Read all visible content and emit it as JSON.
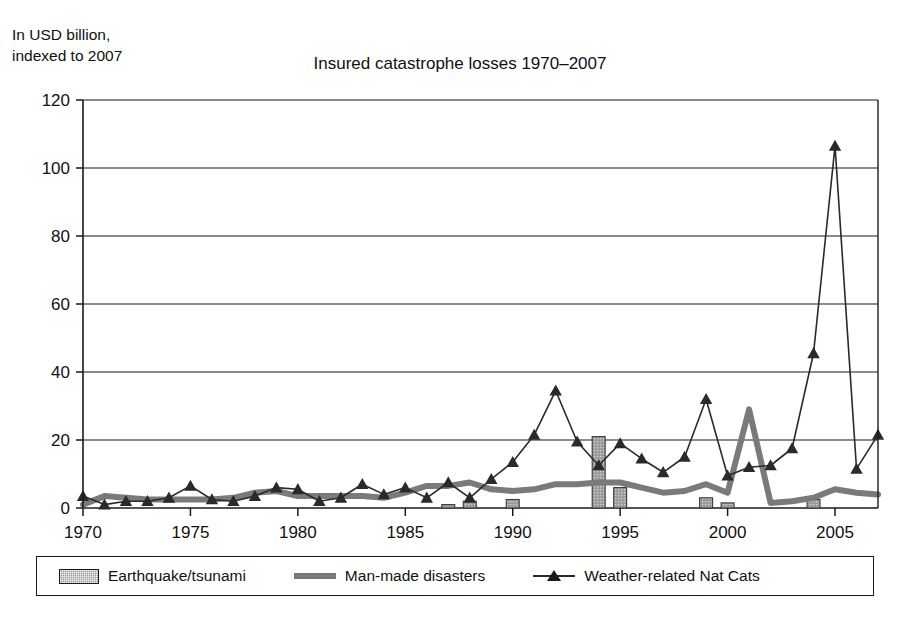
{
  "axis_caption": "In USD billion,\nindexed to 2007",
  "title": "Insured catastrophe losses 1970–2007",
  "legend": {
    "earthquake_label": "Earthquake/tsunami",
    "manmade_label": "Man-made disasters",
    "weather_label": "Weather-related Nat Cats"
  },
  "colors": {
    "earthquake_bar": "#9a9a9a",
    "manmade_line": "#7a7a7a",
    "weather_line": "#2a2a2a",
    "axis": "#1a1a1a",
    "grid": "#1a1a1a",
    "background": "#ffffff"
  },
  "chart_data": {
    "type": "line",
    "title": "Insured catastrophe losses 1970–2007",
    "subtitle": "In USD billion, indexed to 2007",
    "xlabel": "",
    "ylabel": "In USD billion, indexed to 2007",
    "xlim": [
      1970,
      2007
    ],
    "ylim": [
      0,
      120
    ],
    "yticks": [
      0,
      20,
      40,
      60,
      80,
      100,
      120
    ],
    "ytick_labels": [
      "0",
      "20",
      "40",
      "60",
      "80",
      "100",
      "120"
    ],
    "xticks": [
      1970,
      1975,
      1980,
      1985,
      1990,
      1995,
      2000,
      2005
    ],
    "xtick_labels": [
      "1970",
      "1975",
      "1980",
      "1985",
      "1990",
      "1995",
      "2000",
      "2005"
    ],
    "grid": "horizontal",
    "legend_position": "bottom",
    "x": [
      1970,
      1971,
      1972,
      1973,
      1974,
      1975,
      1976,
      1977,
      1978,
      1979,
      1980,
      1981,
      1982,
      1983,
      1984,
      1985,
      1986,
      1987,
      1988,
      1989,
      1990,
      1991,
      1992,
      1993,
      1994,
      1995,
      1996,
      1997,
      1998,
      1999,
      2000,
      2001,
      2002,
      2003,
      2004,
      2005,
      2006,
      2007
    ],
    "series": [
      {
        "name": "Weather-related Nat Cats",
        "type": "line",
        "marker": "triangle",
        "color": "#2a2a2a",
        "values": [
          3.5,
          1.0,
          2.0,
          2.0,
          3.0,
          6.5,
          2.5,
          2.0,
          3.5,
          6.0,
          5.5,
          2.0,
          3.0,
          7.0,
          4.0,
          6.0,
          3.0,
          7.5,
          3.0,
          8.5,
          13.5,
          21.5,
          34.5,
          19.5,
          12.5,
          19.0,
          14.5,
          10.5,
          15.0,
          32.0,
          9.5,
          12.0,
          12.5,
          17.5,
          45.5,
          106.5,
          11.5,
          21.5
        ]
      },
      {
        "name": "Man-made disasters",
        "type": "line",
        "marker": "none",
        "color": "#7a7a7a",
        "values": [
          1.0,
          3.5,
          3.0,
          2.5,
          2.5,
          2.5,
          2.5,
          3.0,
          4.5,
          5.0,
          3.5,
          3.5,
          3.5,
          3.5,
          3.0,
          4.5,
          6.5,
          6.5,
          7.5,
          5.5,
          5.0,
          5.5,
          7.0,
          7.0,
          7.5,
          7.5,
          6.0,
          4.5,
          5.0,
          7.0,
          4.5,
          29.0,
          1.5,
          2.0,
          3.0,
          5.5,
          4.5,
          4.0
        ]
      },
      {
        "name": "Earthquake/tsunami",
        "type": "bar",
        "color": "#9a9a9a",
        "values": [
          0,
          0,
          0,
          0,
          0,
          0,
          0,
          0,
          0,
          0,
          0,
          0,
          0,
          0,
          0,
          0,
          0,
          1.0,
          2.0,
          0,
          2.5,
          0,
          0,
          0,
          21.0,
          6.0,
          0,
          0,
          0,
          3.0,
          1.5,
          0,
          0,
          0,
          2.5,
          0,
          0,
          0
        ]
      }
    ]
  }
}
